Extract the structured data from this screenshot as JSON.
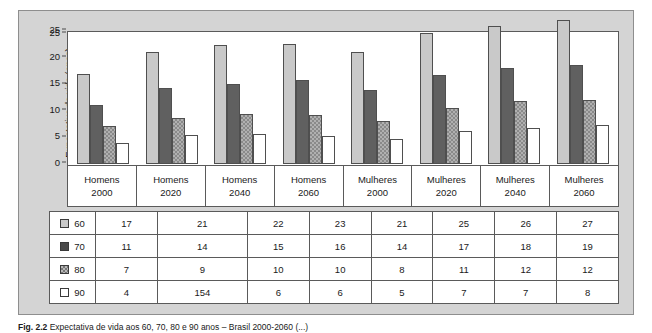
{
  "figure": {
    "caption_label": "Fig. 2.2",
    "caption_text": "Expectativa de vida aos 60, 70, 80 e 90 anos – Brasil 2000-2060 (...)"
  },
  "chart_data": {
    "type": "bar",
    "title": "",
    "xlabel": "",
    "ylabel": "Expectativa de vida (anos)",
    "ylim": [
      0,
      25
    ],
    "ytick_labels": [
      "25",
      "25",
      "20",
      "15",
      "10",
      "5",
      "0"
    ],
    "ytick_values": [
      25,
      25,
      20,
      15,
      10,
      5,
      0
    ],
    "grid": false,
    "legend_position": "table-left",
    "categories": [
      {
        "sex": "Homens",
        "year": "2000"
      },
      {
        "sex": "Homens",
        "year": "2020"
      },
      {
        "sex": "Homens",
        "year": "2040"
      },
      {
        "sex": "Homens",
        "year": "2060"
      },
      {
        "sex": "Mulheres",
        "year": "2000"
      },
      {
        "sex": "Mulheres",
        "year": "2020"
      },
      {
        "sex": "Mulheres",
        "year": "2040"
      },
      {
        "sex": "Mulheres",
        "year": "2060"
      }
    ],
    "series": [
      {
        "name": "60",
        "color": "#c9c9c9",
        "values": [
          17,
          21,
          22,
          23,
          21,
          25,
          26,
          27
        ]
      },
      {
        "name": "70",
        "color": "#606060",
        "values": [
          11,
          14,
          15,
          16,
          14,
          17,
          18,
          19
        ]
      },
      {
        "name": "80",
        "color": "#b0b0b0",
        "values": [
          7,
          9,
          10,
          10,
          8,
          11,
          12,
          12
        ]
      },
      {
        "name": "90",
        "color": "#ffffff",
        "values": [
          4,
          154,
          6,
          6,
          5,
          7,
          7,
          8
        ]
      }
    ],
    "bar_heights": [
      [
        17,
        21,
        22.3,
        22.6,
        21,
        24.6,
        26,
        27
      ],
      [
        11,
        14.2,
        15,
        15.7,
        14,
        16.8,
        18.1,
        18.7
      ],
      [
        7.2,
        8.7,
        9.4,
        9.3,
        8,
        10.6,
        11.8,
        12
      ],
      [
        4,
        5.4,
        5.6,
        5.3,
        4.7,
        6.2,
        6.7,
        7.4
      ]
    ],
    "table_rows": [
      {
        "label": "60",
        "values": [
          "17",
          "21",
          "22",
          "23",
          "21",
          "25",
          "26",
          "27"
        ]
      },
      {
        "label": "70",
        "values": [
          "11",
          "14",
          "15",
          "16",
          "14",
          "17",
          "18",
          "19"
        ]
      },
      {
        "label": "80",
        "values": [
          "7",
          "9",
          "10",
          "10",
          "8",
          "11",
          "12",
          "12"
        ]
      },
      {
        "label": "90",
        "values": [
          "4",
          "154",
          "6",
          "6",
          "5",
          "7",
          "7",
          "8"
        ]
      }
    ]
  },
  "colors": {
    "panel_background": "#d4d4d4",
    "plot_background": "#ffffff",
    "axis_line": "#5a5a5a"
  }
}
